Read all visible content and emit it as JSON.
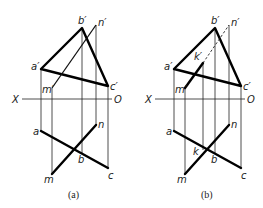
{
  "figure": {
    "panels": [
      {
        "caption": "(a)",
        "axis": {
          "left_label": "X",
          "right_label": "O"
        },
        "labels": {
          "a_prime": "a′",
          "b_prime": "b′",
          "c_prime": "c′",
          "m_prime": "m′",
          "n_prime": "n′",
          "a": "a",
          "b": "b",
          "c": "c",
          "m": "m",
          "n": "n"
        }
      },
      {
        "caption": "(b)",
        "axis": {
          "left_label": "X",
          "right_label": "O"
        },
        "labels": {
          "a_prime": "a′",
          "b_prime": "b′",
          "c_prime": "c′",
          "m_prime": "m′",
          "n_prime": "n′",
          "k_prime": "k′",
          "a": "a",
          "b": "b",
          "c": "c",
          "m": "m",
          "n": "n",
          "k": "k"
        }
      }
    ]
  }
}
